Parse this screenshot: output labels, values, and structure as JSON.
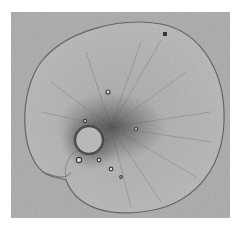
{
  "image": {
    "subject": "micrograph of a single-celled organism with a coiled, rounded body",
    "palette": {
      "border": "#ffffff",
      "background": "#a9a9a9",
      "cell_body": "#b4b4b4",
      "cell_edge": "#5a5a5a",
      "dark_cytoplasm": "#4a4a4a",
      "nucleus": "#bdbdbd"
    }
  }
}
